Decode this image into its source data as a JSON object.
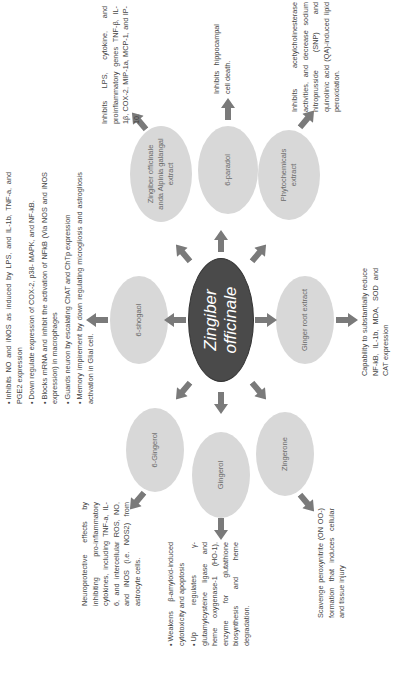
{
  "center": {
    "label_line1": "Zingiber",
    "label_line2": "officinale"
  },
  "nodes": {
    "paradol": {
      "label": "6-paradol",
      "effect": "Inhibits hippocampal cell death."
    },
    "alpinia": {
      "label": "Zingiber officinale anda Alpinia galangal extract",
      "effect": "Inhibits LPS, cytokine, and proinflammatory genes TNF-β, IL-1β, COX-2, MIP-1a, MCP-1, and IP-10."
    },
    "phyto": {
      "label": "Phytochemicals extract",
      "effect": "Inhibits acetylcholinesterase activities, and decrease sodium nitroprusside (SNP) and quinolinic acid (QA)-induced lipid peroxidation."
    },
    "shogaol": {
      "label": "6-shogaol",
      "effects": [
        "Inhibits NO and iNOS as induced by LPS, and IL-1b, TNF-a, and PGE2 expression",
        "Down regulate expression of COX-2, p38- MAPK, and NF-kB.",
        "Blocks mRNA and inhibit the activation of NFkB (Via NOS and iNOS expression) in macrophages",
        "Guards neuron by escalating ChAT and ChTp expression",
        "Memory impirement by down regulating microgliosis and astrogliosis activation in Glial cell."
      ]
    },
    "ginger_root": {
      "label": "Ginger root extract",
      "effect": "Capability to substantially reduce NF-kB, IL-1b, MDA, SOD and CAT expression"
    },
    "gingerol6": {
      "label": "6-Gingerol",
      "effect": "Neuroprotective effects by inhibiting pro-inflammatory cytokines, including TNF-a, IL-6, and intercellular ROS, NO, and iNOS (i.e. NOS2) from astrocyte cells."
    },
    "gingerol": {
      "label": "Gingerol",
      "effects": [
        "Weakens β-amyloid-induced cytotoxicity and apoptosis",
        "Up regulates γ-glutamylcysteine ligase and heme oxygenase-1 (HO-1), enzyme for glutathione biosynthesis and heme degradation."
      ]
    },
    "zingerone": {
      "label": "Zingerone",
      "effect": "Scavenge peroxynitrite (ON OO-) formation that induces cellular and tissue injury"
    }
  },
  "colors": {
    "center_fill": "#4a4a4a",
    "node_fill": "#d8d8d8",
    "arrow": "#7a7a7a",
    "text": "#444444"
  }
}
